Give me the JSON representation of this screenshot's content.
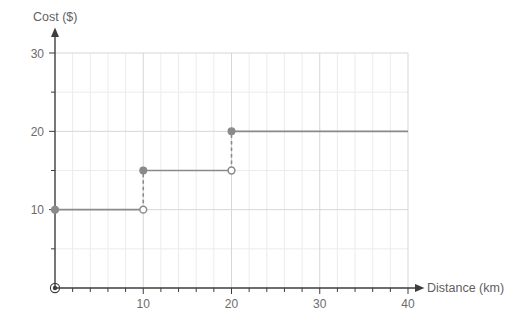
{
  "chart_data": {
    "type": "line",
    "subtype": "step-function",
    "title": "",
    "xlabel": "Distance (km)",
    "ylabel": "Cost ($)",
    "xlim": [
      0,
      40
    ],
    "ylim": [
      0,
      30
    ],
    "x_major_ticks": [
      10,
      20,
      30,
      40
    ],
    "x_major_tick_labels": [
      "10",
      "20",
      "30",
      "40"
    ],
    "x_minor_tick_step": 2,
    "y_major_ticks": [
      10,
      20,
      30
    ],
    "y_major_tick_labels": [
      "10",
      "20",
      "30"
    ],
    "y_minor_ticks": [
      5,
      15,
      25
    ],
    "grid": true,
    "legend": "none",
    "series": [
      {
        "name": "Cost",
        "steps": [
          {
            "x_start": 0,
            "x_end": 10,
            "y": 10,
            "start_closed": true,
            "end_closed": false
          },
          {
            "x_start": 10,
            "x_end": 20,
            "y": 15,
            "start_closed": true,
            "end_closed": false
          },
          {
            "x_start": 20,
            "x_end": 40,
            "y": 20,
            "start_closed": true,
            "end_closed": false
          }
        ],
        "connectors": [
          {
            "x": 10,
            "y_from": 10,
            "y_to": 15,
            "style": "dashed"
          },
          {
            "x": 20,
            "y_from": 15,
            "y_to": 20,
            "style": "dashed"
          }
        ],
        "closed_points": [
          {
            "x": 0,
            "y": 10
          },
          {
            "x": 10,
            "y": 15
          },
          {
            "x": 20,
            "y": 20
          }
        ],
        "open_points": [
          {
            "x": 10,
            "y": 10
          },
          {
            "x": 20,
            "y": 15
          }
        ]
      }
    ],
    "origin_marker": {
      "x": 0,
      "y": 0,
      "style": "bullseye"
    }
  },
  "colors": {
    "background": "#ffffff",
    "axis": "#3d3d3d",
    "grid_minor": "#ececec",
    "grid_major": "#d6d6d6",
    "series": "#8a8a8a",
    "tick_label": "#6b6b6b",
    "axis_title": "#5f5f5f"
  }
}
